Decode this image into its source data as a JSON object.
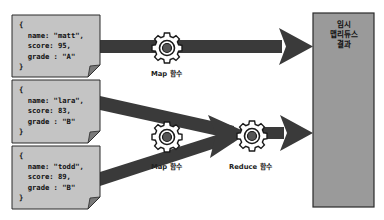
{
  "documents": [
    {
      "open": "{",
      "name_line": "  name: \"matt\",",
      "score_line": "  score: 95,",
      "grade_line": "  grade : \"A\"",
      "close": "}"
    },
    {
      "open": "{",
      "name_line": "  name: \"lara\",",
      "score_line": "  score: 83,",
      "grade_line": "  grade : \"B\"",
      "close": "}"
    },
    {
      "open": "{",
      "name_line": "  name: \"todd\",",
      "score_line": "  score: 89,",
      "grade_line": "  grade : \"B\"",
      "close": "}"
    }
  ],
  "functions": {
    "map_top_label": "Map 함수",
    "map_bottom_label": "Map 함수",
    "reduce_label": "Reduce 함수"
  },
  "result": {
    "line1": "임시",
    "line2": "맵리듀스",
    "line3": "결과"
  },
  "colors": {
    "doc_fill": "#c4c4c4",
    "arrow": "#3a3a3a",
    "result_fill": "#9a9a9a",
    "border": "#2a2a2a"
  }
}
